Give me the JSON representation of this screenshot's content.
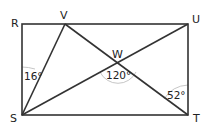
{
  "diagram": {
    "type": "geometry",
    "shape": "rectangle RUTS with segments SV, VT, SU intersecting at W",
    "points": {
      "R": {
        "label": "R",
        "x": 22,
        "y": 24
      },
      "V": {
        "label": "V",
        "x": 65,
        "y": 24
      },
      "U": {
        "label": "U",
        "x": 188,
        "y": 24
      },
      "T": {
        "label": "T",
        "x": 188,
        "y": 115
      },
      "S": {
        "label": "S",
        "x": 22,
        "y": 115
      },
      "W": {
        "label": "W",
        "x": 118,
        "y": 63
      }
    },
    "segments": [
      "RU",
      "UT",
      "TS",
      "SR",
      "SV",
      "VT",
      "SU"
    ],
    "angles": [
      {
        "id": "angle-RSV",
        "label": "16°",
        "vertex": "S"
      },
      {
        "id": "angle-SWT",
        "label": "120°",
        "vertex": "W"
      },
      {
        "id": "angle-UTV",
        "label": "52°",
        "vertex": "T"
      }
    ],
    "stroke_color": "#333333",
    "arc_color": "#b8b8b8"
  }
}
